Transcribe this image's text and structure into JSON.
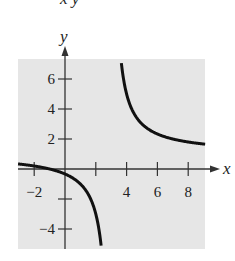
{
  "header": {
    "cropped_equation_fragment": "x    y"
  },
  "chart_data": {
    "type": "line",
    "title": "",
    "xlabel": "x",
    "ylabel": "y",
    "xlim": [
      -3,
      9
    ],
    "ylim": [
      -5,
      7
    ],
    "x_ticks": [
      -2,
      2,
      4,
      6,
      8
    ],
    "x_tick_labels": [
      "-2",
      "4",
      "6",
      "8"
    ],
    "y_ticks": [
      -4,
      -2,
      2,
      4,
      6
    ],
    "y_tick_labels": [
      "-4",
      "2",
      "4",
      "6"
    ],
    "grid": false,
    "background": "#e6e6e6",
    "series": [
      {
        "name": "y = (x+1)/(x-3)",
        "asymptotes": {
          "vertical": 3,
          "horizontal": 1
        },
        "branches": [
          {
            "x": [
              -3,
              -2,
              -1,
              0,
              1,
              2,
              2.33
            ],
            "y": [
              0.33,
              0.2,
              0,
              -0.33,
              -1,
              -3,
              -5
            ]
          },
          {
            "x": [
              3.67,
              4,
              5,
              6,
              7,
              8,
              9
            ],
            "y": [
              7,
              5,
              3,
              2.33,
              2,
              1.8,
              1.67
            ]
          }
        ]
      }
    ]
  }
}
